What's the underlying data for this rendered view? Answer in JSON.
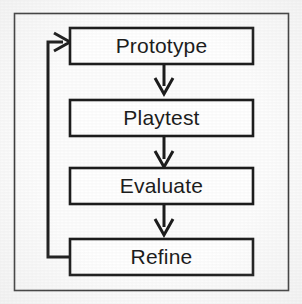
{
  "figure": {
    "background_color": "#fdfdfd",
    "frame_color": "#2b2b2b",
    "line_color": "#1d1d1d",
    "text_color": "#1d1d1d",
    "box_fill": "#ffffff"
  },
  "nodes": [
    {
      "id": "prototype",
      "label": "Prototype"
    },
    {
      "id": "playtest",
      "label": "Playtest"
    },
    {
      "id": "evaluate",
      "label": "Evaluate"
    },
    {
      "id": "refine",
      "label": "Refine"
    }
  ],
  "connectors": [
    {
      "id": "prototype-to-playtest",
      "from": "prototype",
      "to": "playtest",
      "kind": "arrow-down"
    },
    {
      "id": "playtest-to-evaluate",
      "from": "playtest",
      "to": "evaluate",
      "kind": "arrow-down"
    },
    {
      "id": "evaluate-to-refine",
      "from": "evaluate",
      "to": "refine",
      "kind": "arrow-down"
    },
    {
      "id": "refine-to-prototype",
      "from": "refine",
      "to": "prototype",
      "kind": "feedback-loop-left"
    }
  ]
}
